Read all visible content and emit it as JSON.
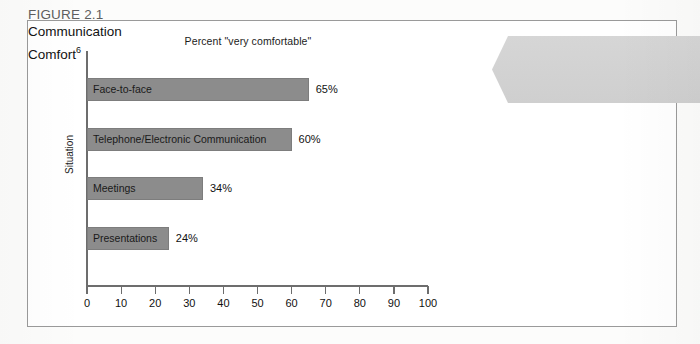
{
  "figure_callout": {
    "number": "FIGURE 2.1",
    "title_line1": "Communication",
    "title_line2": "Comfort",
    "superscript": "6",
    "background_color": "#d2d2d2",
    "number_color": "#5e5e5e",
    "title_color": "#121212"
  },
  "chart_data": {
    "type": "bar",
    "orientation": "horizontal",
    "title": "Percent \"very comfortable\"",
    "xlabel": "",
    "ylabel": "Situation",
    "categories": [
      "Face-to-face",
      "Telephone/Electronic Communication",
      "Meetings",
      "Presentations"
    ],
    "values": [
      65,
      60,
      34,
      24
    ],
    "value_labels": [
      "65%",
      "60%",
      "34%",
      "24%"
    ],
    "xlim": [
      0,
      100
    ],
    "xticks": [
      0,
      10,
      20,
      30,
      40,
      50,
      60,
      70,
      80,
      90,
      100
    ],
    "xtick_labels": [
      "0",
      "10",
      "20",
      "30",
      "40",
      "50",
      "60",
      "70",
      "80",
      "90",
      "100"
    ],
    "grid": false,
    "legend": false,
    "bar_color": "#8c8c8c",
    "axis_color": "#6d6d6d"
  }
}
